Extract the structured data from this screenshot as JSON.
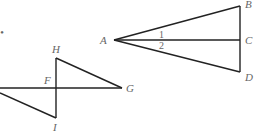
{
  "diagram": {
    "left_figure": {
      "labels": {
        "H": "H",
        "F": "F",
        "G": "G",
        "I": "I"
      }
    },
    "right_figure": {
      "labels": {
        "A": "A",
        "B": "B",
        "C": "C",
        "D": "D"
      },
      "angles": {
        "angle1": "1",
        "angle2": "2"
      }
    },
    "edge_fragment": "•"
  }
}
